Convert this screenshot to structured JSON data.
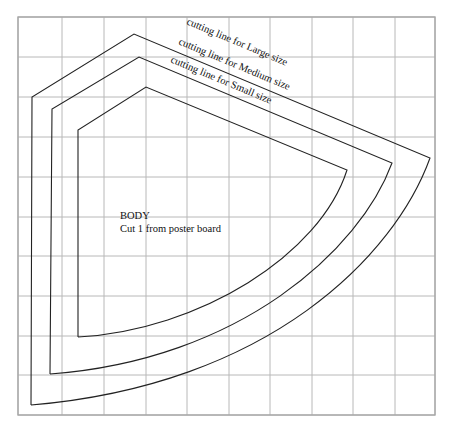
{
  "diagram": {
    "type": "sewing-pattern",
    "grid": {
      "x_lines": [
        18,
        62,
        104,
        146,
        187,
        229,
        270,
        312,
        353,
        395,
        435
      ],
      "y_lines": [
        17,
        57,
        97,
        137,
        177,
        217,
        256,
        296,
        336,
        375,
        415
      ],
      "color": "#b8b8b8"
    },
    "piece": {
      "title": "BODY",
      "instruction": "Cut 1 from poster board"
    },
    "cutting_lines": [
      {
        "size": "Large",
        "label": "cutting line for Large size",
        "path": "M31,405 L32,97 L134,34 L430,158 C395,255 270,385 31,405"
      },
      {
        "size": "Medium",
        "label": "cutting line for Medium size",
        "path": "M50,374 L52,109 L139,57 L392,163 C360,250 240,360 50,374"
      },
      {
        "size": "Small",
        "label": "cutting line for Small size",
        "path": "M78,337 L78,130 L146,87 L347,170 C320,255 200,330 78,337"
      }
    ]
  }
}
